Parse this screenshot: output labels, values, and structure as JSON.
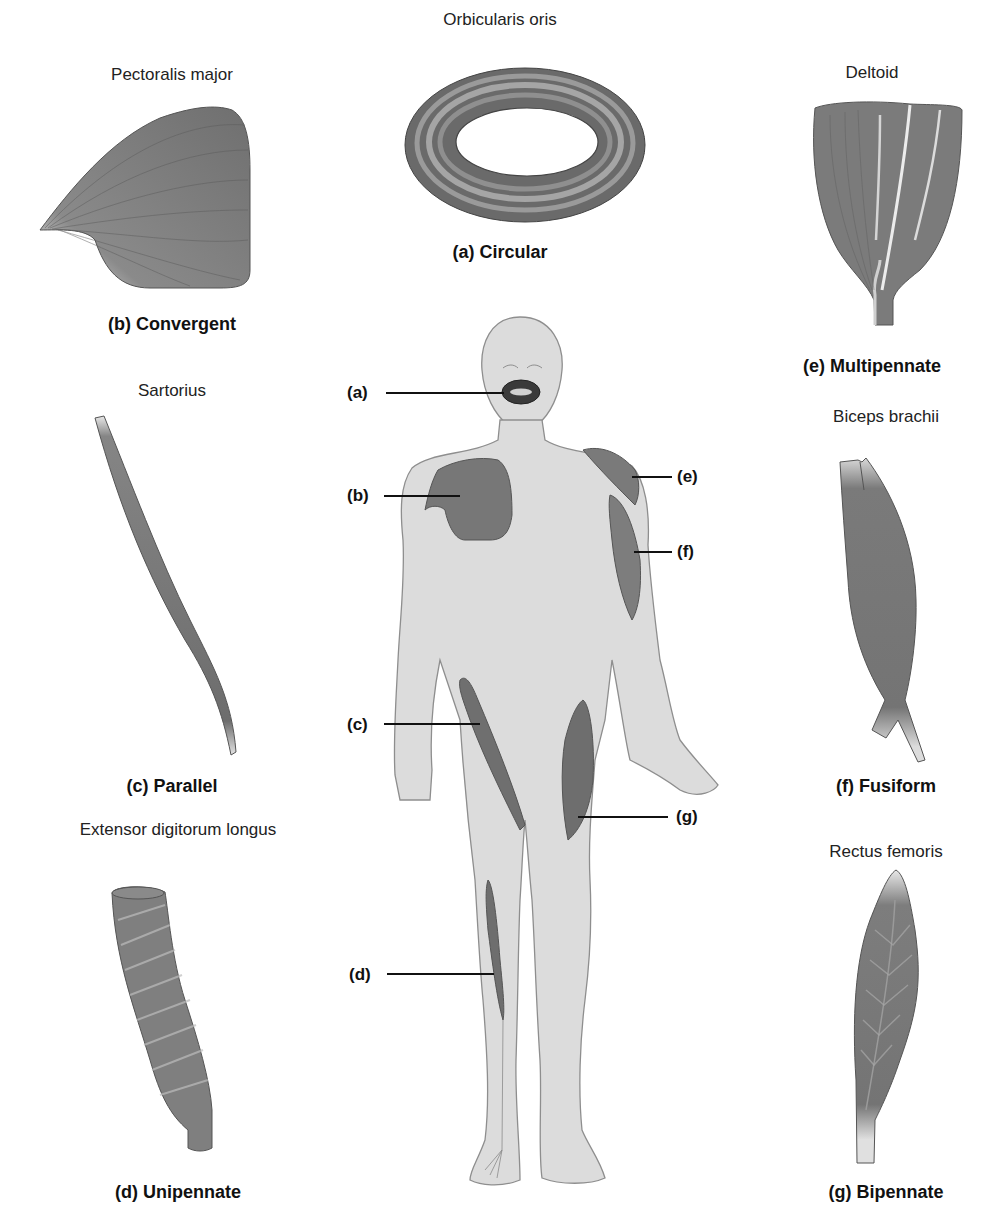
{
  "figure": {
    "colors": {
      "muscle_fill": "#7a7a7a",
      "muscle_dark": "#5a5a5a",
      "tendon_light": "#e6e6e6",
      "skin": "#d9d9d9",
      "skin_outline": "#9a9a9a",
      "text": "#111111",
      "background": "#ffffff"
    },
    "panels": [
      {
        "id": "a",
        "muscle": "Orbicularis oris",
        "type_label": "(a) Circular"
      },
      {
        "id": "b",
        "muscle": "Pectoralis major",
        "type_label": "(b) Convergent"
      },
      {
        "id": "c",
        "muscle": "Sartorius",
        "type_label": "(c) Parallel"
      },
      {
        "id": "d",
        "muscle": "Extensor digitorum longus",
        "type_label": "(d) Unipennate"
      },
      {
        "id": "e",
        "muscle": "Deltoid",
        "type_label": "(e) Multipennate"
      },
      {
        "id": "f",
        "muscle": "Biceps brachii",
        "type_label": "(f) Fusiform"
      },
      {
        "id": "g",
        "muscle": "Rectus femoris",
        "type_label": "(g) Bipennate"
      }
    ],
    "callouts": [
      {
        "letter": "(a)",
        "side": "left"
      },
      {
        "letter": "(b)",
        "side": "left"
      },
      {
        "letter": "(c)",
        "side": "left"
      },
      {
        "letter": "(d)",
        "side": "left"
      },
      {
        "letter": "(e)",
        "side": "right"
      },
      {
        "letter": "(f)",
        "side": "right"
      },
      {
        "letter": "(g)",
        "side": "right"
      }
    ]
  }
}
